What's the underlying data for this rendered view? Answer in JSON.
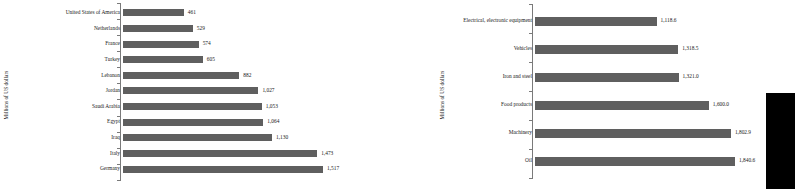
{
  "charts": [
    {
      "id": "left",
      "ylabel": "Millions of US dollars",
      "chart_data": {
        "type": "bar",
        "orientation": "horizontal",
        "title": "",
        "xlabel": "",
        "ylabel": "Millions of US dollars",
        "grid": false,
        "legend": "none",
        "xlim": [
          0,
          1517
        ],
        "categories": [
          "United States of America",
          "Netherlands",
          "France",
          "Turkey",
          "Lebanon",
          "Jordan",
          "Saudi Arabia",
          "Egypt",
          "Iraq",
          "Italy",
          "Germany"
        ],
        "values": [
          461,
          529,
          574,
          605,
          882,
          1027,
          1053,
          1064,
          1130,
          1473,
          1517
        ],
        "labels": [
          "461",
          "529",
          "574",
          "605",
          "882",
          "1,027",
          "1,053",
          "1,064",
          "1,130",
          "1,473",
          "1,517"
        ]
      }
    },
    {
      "id": "right",
      "ylabel": "Millions of US dollars",
      "chart_data": {
        "type": "bar",
        "orientation": "horizontal",
        "title": "",
        "xlabel": "",
        "ylabel": "Millions of US dollars",
        "grid": false,
        "legend": "none",
        "xlim": [
          0,
          1840.6
        ],
        "categories": [
          "Electrical, electronic equipment",
          "Vehicles",
          "Iron and steel",
          "Food products",
          "Machinery",
          "Oil"
        ],
        "values": [
          1118.6,
          1318.5,
          1321.0,
          1600.0,
          1802.9,
          1840.6
        ],
        "labels": [
          "1,118.6",
          "1,318.5",
          "1,321.0",
          "1,600.0",
          "1,802.9",
          "1,840.6"
        ]
      }
    }
  ],
  "colors": {
    "bar": "#5f5f5f",
    "axis": "#7a7a7a",
    "text": "#1a1a1a",
    "block": "#000000"
  }
}
